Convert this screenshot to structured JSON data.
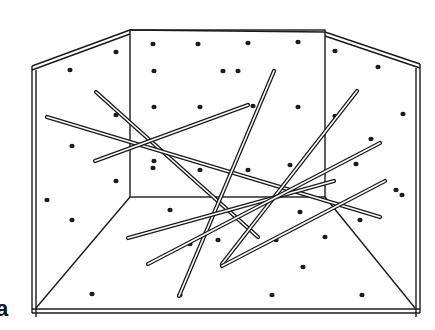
{
  "figure": {
    "panel_label": "a",
    "stroke_color": "#1a1a1a",
    "background": "#ffffff",
    "frame": {
      "outer_left": [
        [
          32,
          66
        ],
        [
          32,
          313
        ]
      ],
      "outer_bottom": [
        [
          32,
          313
        ],
        [
          420,
          313
        ]
      ],
      "outer_right": [
        [
          420,
          64
        ],
        [
          420,
          313
        ]
      ],
      "top_left_edge": [
        [
          32,
          66
        ],
        [
          130,
          30
        ]
      ],
      "top_right_edge": [
        [
          325,
          32
        ],
        [
          420,
          64
        ]
      ],
      "back_wall": {
        "x1": 130,
        "y1": 30,
        "x2": 325,
        "y2": 197
      },
      "floor_left_diag": [
        [
          130,
          197
        ],
        [
          36,
          308
        ]
      ],
      "floor_right_diag": [
        [
          325,
          197
        ],
        [
          415,
          308
        ]
      ]
    },
    "dots": [
      [
        70,
        70
      ],
      [
        116,
        52
      ],
      [
        153,
        44
      ],
      [
        198,
        44
      ],
      [
        248,
        43
      ],
      [
        298,
        42
      ],
      [
        335,
        51
      ],
      [
        378,
        67
      ],
      [
        154,
        71
      ],
      [
        223,
        71
      ],
      [
        238,
        71
      ],
      [
        154,
        107
      ],
      [
        200,
        107
      ],
      [
        253,
        106
      ],
      [
        298,
        107
      ],
      [
        335,
        116
      ],
      [
        403,
        114
      ],
      [
        72,
        146
      ],
      [
        116,
        115
      ],
      [
        154,
        161
      ],
      [
        200,
        170
      ],
      [
        248,
        170
      ],
      [
        290,
        165
      ],
      [
        371,
        139
      ],
      [
        153,
        168
      ],
      [
        47,
        200
      ],
      [
        72,
        220
      ],
      [
        116,
        181
      ],
      [
        170,
        210
      ],
      [
        218,
        240
      ],
      [
        300,
        212
      ],
      [
        402,
        195
      ],
      [
        190,
        244
      ],
      [
        276,
        240
      ],
      [
        325,
        237
      ],
      [
        360,
        220
      ],
      [
        92,
        294
      ],
      [
        180,
        295
      ],
      [
        272,
        295
      ],
      [
        303,
        267
      ],
      [
        362,
        295
      ],
      [
        396,
        190
      ],
      [
        356,
        164
      ]
    ],
    "sticks": [
      {
        "from": [
          96,
          92
        ],
        "to": [
          258,
          237
        ]
      },
      {
        "from": [
          47,
          117
        ],
        "to": [
          380,
          217
        ]
      },
      {
        "from": [
          95,
          161
        ],
        "to": [
          248,
          105
        ]
      },
      {
        "from": [
          179,
          296
        ],
        "to": [
          274,
          71
        ]
      },
      {
        "from": [
          222,
          264
        ],
        "to": [
          357,
          91
        ]
      },
      {
        "from": [
          128,
          238
        ],
        "to": [
          334,
          181
        ]
      },
      {
        "from": [
          148,
          264
        ],
        "to": [
          380,
          143
        ]
      },
      {
        "from": [
          222,
          266
        ],
        "to": [
          385,
          181
        ]
      }
    ]
  }
}
